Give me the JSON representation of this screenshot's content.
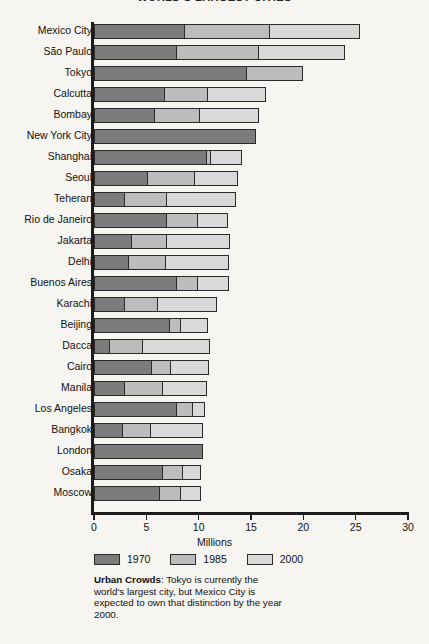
{
  "chart_data": {
    "type": "bar",
    "orientation": "horizontal",
    "stacked": true,
    "title": "WORLD'S LARGEST CITIES",
    "xlabel": "Millions",
    "ylabel": "",
    "xlim": [
      0,
      30
    ],
    "xticks": [
      0,
      5,
      10,
      15,
      20,
      25,
      30
    ],
    "xtick_labels": [
      "0",
      "5",
      "10",
      "15",
      "20",
      "25",
      "30"
    ],
    "grid": false,
    "legend_position": "bottom-left",
    "categories": [
      "Mexico City",
      "São Paulo",
      "Tokyo",
      "Calcutta",
      "Bombay",
      "New York City",
      "Shanghai",
      "Seoul",
      "Teheran",
      "Rio de Janeiro",
      "Jakarta",
      "Delhi",
      "Buenos Aires",
      "Karachi",
      "Beijing",
      "Dacca",
      "Cairo",
      "Manila",
      "Los Angeles",
      "Bangkok",
      "London",
      "Osaka",
      "Moscow"
    ],
    "series": [
      {
        "name": "1970",
        "color": "#7c7c7c",
        "values": [
          8.7,
          8.0,
          14.6,
          6.8,
          5.9,
          15.5,
          10.8,
          5.2,
          3.0,
          7.0,
          3.7,
          3.4,
          8.0,
          3.0,
          7.3,
          1.6,
          5.6,
          3.0,
          8.0,
          2.8,
          10.4,
          6.6,
          6.3
        ]
      },
      {
        "name": "1985",
        "color": "#bcbcbc",
        "values": [
          8.1,
          7.8,
          5.4,
          4.1,
          4.3,
          0.0,
          0.4,
          4.5,
          4.0,
          3.0,
          3.3,
          3.5,
          2.0,
          3.1,
          1.0,
          3.1,
          1.8,
          3.6,
          1.5,
          2.7,
          0.0,
          1.9,
          2.0
        ]
      },
      {
        "name": "2000",
        "color": "#d9d9d9",
        "values": [
          8.6,
          8.2,
          0.0,
          5.5,
          5.6,
          0.0,
          2.9,
          4.1,
          6.6,
          2.8,
          6.0,
          6.0,
          2.9,
          5.7,
          2.6,
          6.4,
          3.6,
          4.2,
          1.1,
          4.9,
          0.0,
          1.7,
          1.9
        ]
      }
    ],
    "totals": [
      25.4,
      24.0,
      20.0,
      16.4,
      15.8,
      15.5,
      14.1,
      13.8,
      13.6,
      12.8,
      13.0,
      12.9,
      12.9,
      11.8,
      10.9,
      11.1,
      11.0,
      10.8,
      10.6,
      10.4,
      10.4,
      10.2,
      10.2
    ]
  },
  "legend": {
    "items": [
      {
        "label": "1970",
        "color": "#7c7c7c"
      },
      {
        "label": "1985",
        "color": "#bcbcbc"
      },
      {
        "label": "2000",
        "color": "#d9d9d9"
      }
    ]
  },
  "caption": {
    "lead": "Urban Crowds",
    "body": ": Tokyo is currently the world's largest city, but Mexico City is expected to own that distinction by the year 2000."
  },
  "colors": {
    "background": "#f6f5f1",
    "axis": "#1c1c1c",
    "bar_outline": "#2a2a2a",
    "text": "#111111"
  }
}
